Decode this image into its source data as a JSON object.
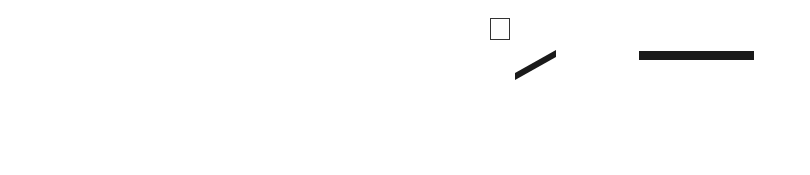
{
  "rehearsal_mark": "C",
  "staff": {
    "lines_y": [
      51,
      71,
      90,
      110,
      130
    ],
    "x_start": 41,
    "x_end": 777,
    "barlines_x": [
      41,
      256,
      471,
      777
    ],
    "color": "#2b2b2b"
  },
  "rests": [
    {
      "x": 145,
      "y": 71
    },
    {
      "x": 360,
      "y": 71
    }
  ],
  "notes": [
    {
      "label": "E",
      "x": 503,
      "y": 130,
      "stem_x": 515,
      "lyric": "May"
    },
    {
      "label": "G",
      "x": 543,
      "y": 110,
      "stem_x": 556,
      "lyric": "be"
    },
    {
      "label": "G",
      "x": 580,
      "y": 110,
      "stem_x": 593,
      "lyric": "it's"
    },
    {
      "label": "G",
      "x": 626,
      "y": 110,
      "stem_x": 639,
      "lyric": "time"
    },
    {
      "label": "G",
      "x": 666,
      "y": 110,
      "stem_x": 679,
      "lyric": "to"
    },
    {
      "label": "G",
      "x": 703,
      "y": 110,
      "stem_x": 716,
      "lyric": "let"
    },
    {
      "label": "G",
      "x": 740,
      "y": 110,
      "stem_x": 753,
      "lyric": "the"
    }
  ],
  "lyrics": [
    {
      "text": "May",
      "x": 503
    },
    {
      "text": "-",
      "x": 526
    },
    {
      "text": "be",
      "x": 543
    },
    {
      "text": "it's",
      "x": 580
    },
    {
      "text": "time",
      "x": 626
    },
    {
      "text": "to",
      "x": 666
    },
    {
      "text": "let",
      "x": 703
    },
    {
      "text": "the",
      "x": 742
    }
  ]
}
